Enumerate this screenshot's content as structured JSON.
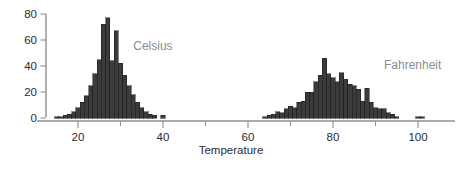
{
  "chart_data": {
    "type": "bar",
    "title": "",
    "subtitle": "",
    "xlabel": "Temperature",
    "ylabel": "",
    "xlim": [
      12,
      104
    ],
    "ylim": [
      0,
      84
    ],
    "x_ticks": [
      20,
      40,
      60,
      80,
      100
    ],
    "x_tick_labels": [
      "20",
      "40",
      "60",
      "80",
      "100"
    ],
    "x_minor_ticks": [
      30,
      50,
      70,
      90
    ],
    "y_ticks": [
      0,
      20,
      40,
      60,
      80
    ],
    "y_tick_labels": [
      "0",
      "20",
      "40",
      "60",
      "80"
    ],
    "grid": false,
    "legend_position": "inline-annotation",
    "bar_color": "#3b3b3b",
    "bar_edge_color": "#1a1a1a",
    "annotation_color": "#8d8d8d",
    "axis_color": "#8f8f8f",
    "bin_width": 1,
    "series": [
      {
        "name": "Celsius",
        "label_x": 33,
        "label_y": 52,
        "x": [
          15,
          16,
          17,
          18,
          19,
          20,
          21,
          22,
          23,
          24,
          25,
          26,
          27,
          28,
          29,
          30,
          31,
          32,
          33,
          34,
          35,
          36,
          37,
          38,
          39,
          40
        ],
        "values": [
          1,
          1,
          2,
          3,
          5,
          8,
          12,
          17,
          25,
          34,
          45,
          72,
          77,
          44,
          67,
          42,
          33,
          25,
          18,
          12,
          8,
          5,
          3,
          2,
          0,
          2
        ]
      },
      {
        "name": "Fahrenheit",
        "label_x": 92,
        "label_y": 38,
        "x": [
          64,
          65,
          66,
          67,
          68,
          69,
          70,
          71,
          72,
          73,
          74,
          75,
          76,
          77,
          78,
          79,
          80,
          81,
          82,
          83,
          84,
          85,
          86,
          87,
          88,
          89,
          90,
          91,
          92,
          93,
          94,
          95,
          96,
          97,
          98,
          99,
          100,
          101
        ],
        "values": [
          1,
          2,
          3,
          5,
          4,
          7,
          9,
          8,
          12,
          13,
          20,
          20,
          28,
          33,
          46,
          34,
          31,
          28,
          35,
          30,
          26,
          25,
          22,
          13,
          23,
          12,
          8,
          7,
          7,
          4,
          3,
          1,
          0,
          0,
          0,
          0,
          1,
          1
        ]
      }
    ]
  }
}
